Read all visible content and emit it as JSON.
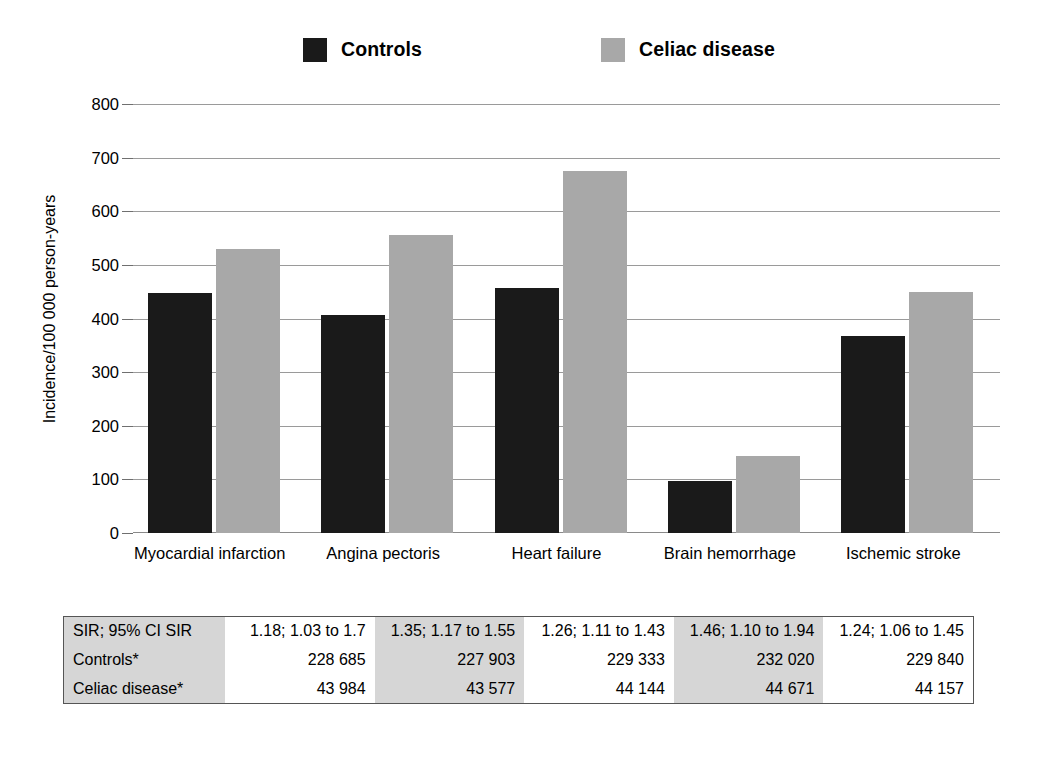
{
  "legend": {
    "items": [
      {
        "label": "Controls",
        "color": "#1a1a1a",
        "icon": "square-swatch"
      },
      {
        "label": "Celiac disease",
        "color": "#a8a8a8",
        "icon": "square-swatch"
      }
    ]
  },
  "chart_data": {
    "type": "bar",
    "title": "",
    "xlabel": "",
    "ylabel": "Incidence/100 000 person-years",
    "ylim": [
      0,
      800
    ],
    "yticks": [
      0,
      100,
      200,
      300,
      400,
      500,
      600,
      700,
      800
    ],
    "ytick_labels": [
      "0",
      "100",
      "200",
      "300",
      "400",
      "500",
      "600",
      "700",
      "800"
    ],
    "grid": true,
    "legend_position": "top",
    "categories": [
      "Myocardial infarction",
      "Angina pectoris",
      "Heart failure",
      "Brain hemorrhage",
      "Ischemic stroke"
    ],
    "series": [
      {
        "name": "Controls",
        "color": "#1a1a1a",
        "values": [
          447,
          406,
          456,
          97,
          367
        ]
      },
      {
        "name": "Celiac disease",
        "color": "#a8a8a8",
        "values": [
          530,
          556,
          675,
          143,
          449
        ]
      }
    ]
  },
  "table": {
    "row_labels": [
      "SIR; 95% CI SIR",
      "Controls*",
      "Celiac disease*"
    ],
    "rows": [
      {
        "label": "SIR; 95% CI SIR",
        "values": [
          "1.18; 1.03 to 1.7",
          "1.35; 1.17 to 1.55",
          "1.26; 1.11 to 1.43",
          "1.46; 1.10 to 1.94",
          "1.24; 1.06 to 1.45"
        ]
      },
      {
        "label": "Controls*",
        "values": [
          "228 685",
          "227 903",
          "229 333",
          "232 020",
          "229 840"
        ]
      },
      {
        "label": "Celiac disease*",
        "values": [
          "43 984",
          "43 577",
          "44 144",
          "44 671",
          "44 157"
        ]
      }
    ],
    "shaded_columns": [
      1,
      3
    ]
  },
  "colors": {
    "controls": "#1a1a1a",
    "celiac": "#a8a8a8",
    "table_shade": "#d6d6d6",
    "gridline": "#9a9a9a"
  }
}
